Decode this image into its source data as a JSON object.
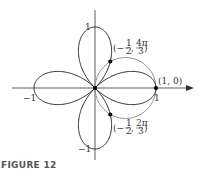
{
  "chart_data": {
    "type": "line",
    "title": "",
    "caption": "FIGURE 12",
    "coordinate_system": "polar",
    "series": [
      {
        "name": "r = cos 2θ",
        "description": "four-leaved rose",
        "color": "#222222"
      },
      {
        "name": "r = cos θ",
        "description": "circle",
        "color": "#888888"
      }
    ],
    "points": [
      {
        "label": "(1, 0)",
        "x": 1,
        "y": 0
      },
      {
        "label": "(−1/2, 4π/3)",
        "x": 0.25,
        "y": 0.433
      },
      {
        "label": "(−1/2, 2π/3)",
        "x": 0.25,
        "y": -0.433
      },
      {
        "label": "",
        "x": 0,
        "y": 0
      }
    ],
    "tick_labels": {
      "x_pos": "1",
      "x_neg": "−1",
      "y_pos": "1",
      "y_neg": "−1"
    },
    "xlim": [
      -1.1,
      1.3
    ],
    "ylim": [
      -1.1,
      1.1
    ]
  },
  "labels": {
    "x_pos": "1",
    "x_neg": "−1",
    "y_pos": "1",
    "y_neg": "−1",
    "p1": "(1, 0)",
    "p2_pre": "(−",
    "p2_n1": "1",
    "p2_d1": "2",
    "p2_mid": ",",
    "p2_n2": "4π",
    "p2_d2": "3",
    "p2_post": ")",
    "p3_pre": "(−",
    "p3_n1": "1",
    "p3_d1": "2",
    "p3_mid": ",",
    "p3_n2": "2π",
    "p3_d2": "3",
    "p3_post": ")",
    "caption": "FIGURE 12"
  }
}
